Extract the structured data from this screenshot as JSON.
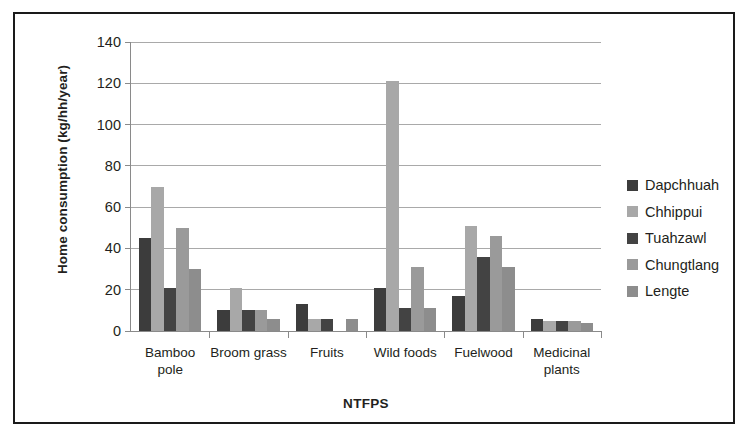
{
  "chart_data": {
    "type": "bar",
    "title": "",
    "xlabel": "NTFPS",
    "ylabel": "Home consumption (kg/hh/year)",
    "ylim": [
      0,
      140
    ],
    "ytick_interval": 20,
    "yticks": [
      0,
      20,
      40,
      60,
      80,
      100,
      120,
      140
    ],
    "ytick_labels": [
      "0",
      "20",
      "40",
      "60",
      "80",
      "100",
      "120",
      "140"
    ],
    "grid": true,
    "legend_position": "right",
    "categories": [
      "Bamboo\npole",
      "Broom grass",
      "Fruits",
      "Wild foods",
      "Fuelwood",
      "Medicinal\nplants"
    ],
    "series": [
      {
        "name": "Dapchhuah",
        "color": "#3c3c3c",
        "values": [
          45,
          10,
          13,
          21,
          17,
          6
        ]
      },
      {
        "name": "Chhippui",
        "color": "#a8a8a8",
        "values": [
          70,
          21,
          6,
          121,
          51,
          5
        ]
      },
      {
        "name": "Tuahzawl",
        "color": "#434343",
        "values": [
          21,
          10,
          6,
          11,
          36,
          5
        ]
      },
      {
        "name": "Chungtlang",
        "color": "#9a9a9a",
        "values": [
          50,
          10,
          0,
          31,
          46,
          5
        ]
      },
      {
        "name": "Lengte",
        "color": "#8d8d8d",
        "values": [
          30,
          6,
          6,
          11,
          31,
          4
        ]
      }
    ]
  }
}
